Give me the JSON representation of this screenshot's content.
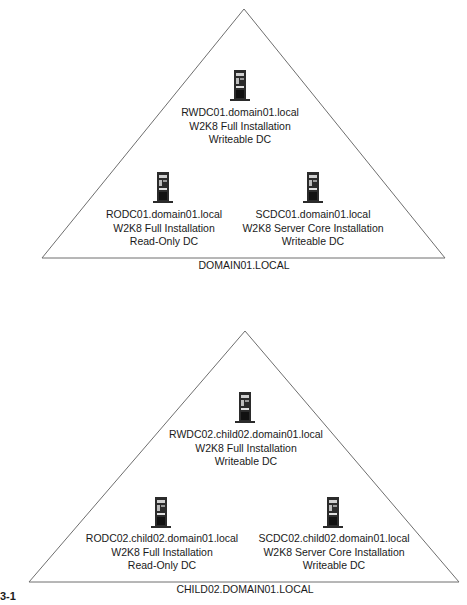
{
  "figure": {
    "label": "3-1"
  },
  "domains": [
    {
      "name": "DOMAIN01.LOCAL",
      "servers": [
        {
          "role": "writeable",
          "lines": [
            "RWDC01.domain01.local",
            "W2K8 Full Installation",
            "Writeable DC"
          ],
          "icon": "server-tower-icon"
        },
        {
          "role": "read-only",
          "lines": [
            "RODC01.domain01.local",
            "W2K8 Full Installation",
            "Read-Only DC"
          ],
          "icon": "server-tower-icon"
        },
        {
          "role": "server-core",
          "lines": [
            "SCDC01.domain01.local",
            "W2K8 Server Core Installation",
            "Writeable DC"
          ],
          "icon": "server-tower-icon"
        }
      ]
    },
    {
      "name": "CHILD02.DOMAIN01.LOCAL",
      "servers": [
        {
          "role": "writeable",
          "lines": [
            "RWDC02.child02.domain01.local",
            "W2K8 Full Installation",
            "Writeable DC"
          ],
          "icon": "server-tower-icon"
        },
        {
          "role": "read-only",
          "lines": [
            "RODC02.child02.domain01.local",
            "W2K8 Full Installation",
            "Read-Only DC"
          ],
          "icon": "server-tower-icon"
        },
        {
          "role": "server-core",
          "lines": [
            "SCDC02.child02.domain01.local",
            "W2K8 Server Core Installation",
            "Writeable DC"
          ],
          "icon": "server-tower-icon"
        }
      ]
    }
  ],
  "colors": {
    "line": "#6e6e6e",
    "text": "#1a1a1a",
    "server_body": "#2b2b2b",
    "background": "#ffffff"
  }
}
